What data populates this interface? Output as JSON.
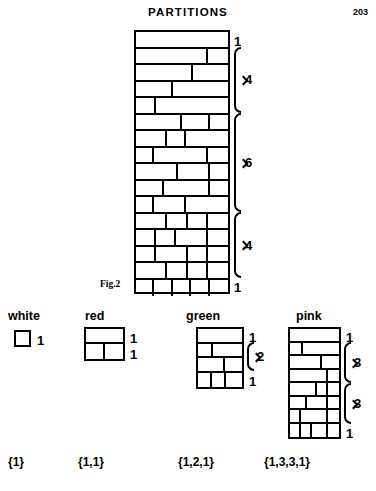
{
  "header": {
    "title": "PARTITIONS",
    "page_number": "203"
  },
  "figure": {
    "label": "Fig.2",
    "annotations": [
      "1",
      "4",
      "6",
      "4",
      "1"
    ]
  },
  "legend": [
    {
      "name": "white",
      "title": "white",
      "caption": "{1}",
      "annotations": [
        "1"
      ]
    },
    {
      "name": "red",
      "title": "red",
      "caption": "{1,1}",
      "annotations": [
        "1",
        "1"
      ]
    },
    {
      "name": "green",
      "title": "green",
      "caption": "{1,2,1}",
      "annotations": [
        "1",
        "2",
        "1"
      ]
    },
    {
      "name": "pink",
      "title": "pink",
      "caption": "{1,3,3,1}",
      "annotations": [
        "1",
        "3",
        "3",
        "1"
      ]
    }
  ],
  "chart_data": {
    "type": "diagram",
    "title": "PARTITIONS",
    "figures": [
      {
        "name": "main",
        "label": "Fig.2",
        "caption": "",
        "row_count": 16,
        "group_labels": [
          "1",
          "4",
          "6",
          "4",
          "1"
        ],
        "group_sizes": [
          1,
          4,
          6,
          4,
          1
        ],
        "rows": [
          [
            1.0
          ],
          [
            0.78,
            0.22
          ],
          [
            0.62,
            0.38
          ],
          [
            0.4,
            0.6
          ],
          [
            0.22,
            0.78
          ],
          [
            0.5,
            0.3,
            0.2
          ],
          [
            0.34,
            0.2,
            0.46
          ],
          [
            0.2,
            0.58,
            0.22
          ],
          [
            0.46,
            0.34,
            0.2
          ],
          [
            0.3,
            0.5,
            0.2
          ],
          [
            0.2,
            0.34,
            0.46
          ],
          [
            0.34,
            0.22,
            0.22,
            0.22
          ],
          [
            0.22,
            0.22,
            0.34,
            0.22
          ],
          [
            0.22,
            0.34,
            0.22,
            0.22
          ],
          [
            0.34,
            0.22,
            0.22,
            0.22
          ],
          [
            0.2,
            0.2,
            0.2,
            0.2,
            0.2
          ]
        ]
      },
      {
        "name": "white",
        "label": "white",
        "caption": "{1}",
        "row_count": 1,
        "group_labels": [
          "1"
        ],
        "group_sizes": [
          1
        ],
        "rows": [
          [
            1.0
          ]
        ]
      },
      {
        "name": "red",
        "label": "red",
        "caption": "{1,1}",
        "row_count": 2,
        "group_labels": [
          "1",
          "1"
        ],
        "group_sizes": [
          1,
          1
        ],
        "rows": [
          [
            1.0
          ],
          [
            0.5,
            0.5
          ]
        ]
      },
      {
        "name": "green",
        "label": "green",
        "caption": "{1,2,1}",
        "row_count": 4,
        "group_labels": [
          "1",
          "2",
          "1"
        ],
        "group_sizes": [
          1,
          2,
          1
        ],
        "rows": [
          [
            1.0
          ],
          [
            0.34,
            0.66
          ],
          [
            0.62,
            0.38
          ],
          [
            0.32,
            0.32,
            0.36
          ]
        ]
      },
      {
        "name": "pink",
        "label": "pink",
        "caption": "{1,3,3,1}",
        "row_count": 8,
        "group_labels": [
          "1",
          "3",
          "3",
          "1"
        ],
        "group_sizes": [
          1,
          3,
          3,
          1
        ],
        "rows": [
          [
            1.0
          ],
          [
            0.26,
            0.74
          ],
          [
            0.66,
            0.34
          ],
          [
            0.78,
            0.22
          ],
          [
            0.56,
            0.22,
            0.22
          ],
          [
            0.34,
            0.44,
            0.22
          ],
          [
            0.22,
            0.56,
            0.22
          ],
          [
            0.22,
            0.22,
            0.34,
            0.22
          ]
        ]
      }
    ]
  }
}
